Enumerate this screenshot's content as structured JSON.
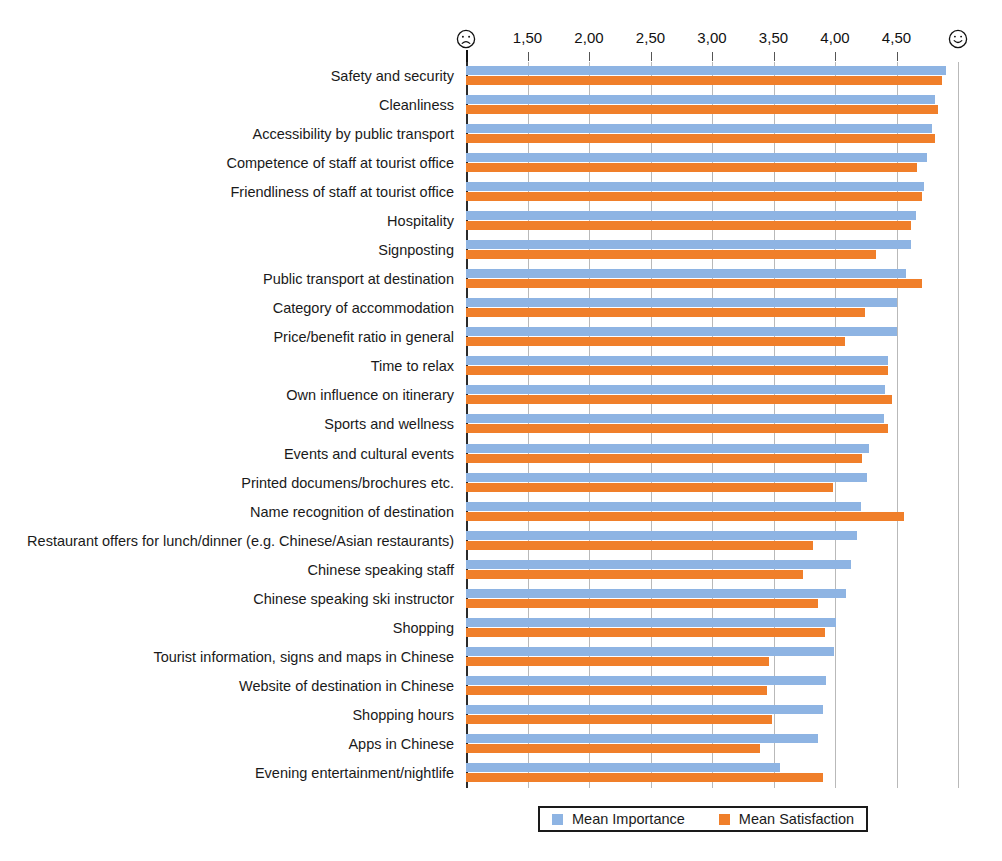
{
  "chart_data": {
    "type": "bar",
    "orientation": "horizontal",
    "title": "",
    "xlabel": "",
    "ylabel": "",
    "xlim": [
      1.0,
      5.0
    ],
    "grid": true,
    "legend_position": "bottom-center",
    "axis": {
      "tick_values": [
        1.5,
        2.0,
        2.5,
        3.0,
        3.5,
        4.0,
        4.5
      ],
      "tick_labels": [
        "1,50",
        "2,00",
        "2,50",
        "3,00",
        "3,50",
        "4,00",
        "4,50"
      ],
      "start_icon": "frowning-face-icon",
      "end_icon": "smiling-face-icon",
      "start_value": 1.0,
      "end_value": 5.0
    },
    "categories": [
      "Safety and security",
      "Cleanliness",
      "Accessibility by public transport",
      "Competence of staff at tourist office",
      "Friendliness of staff at tourist office",
      "Hospitality",
      "Signposting",
      "Public transport at destination",
      "Category of accommodation",
      "Price/benefit ratio in general",
      "Time to relax",
      "Own influence on itinerary",
      "Sports and wellness",
      "Events and cultural events",
      "Printed documens/brochures etc.",
      "Name recognition of destination",
      "Restaurant offers for lunch/dinner (e.g. Chinese/Asian restaurants)",
      "Chinese speaking staff",
      "Chinese speaking ski instructor",
      "Shopping",
      "Tourist information, signs and maps in Chinese",
      "Website of destination in Chinese",
      "Shopping hours",
      "Apps in Chinese",
      "Evening entertainment/nightlife"
    ],
    "series": [
      {
        "name": "Mean Importance",
        "color": "#8eb4e3",
        "values": [
          4.9,
          4.81,
          4.79,
          4.75,
          4.72,
          4.66,
          4.62,
          4.58,
          4.5,
          4.5,
          4.43,
          4.41,
          4.4,
          4.28,
          4.26,
          4.21,
          4.18,
          4.13,
          4.09,
          4.01,
          3.99,
          3.93,
          3.9,
          3.86,
          3.55
        ]
      },
      {
        "name": "Mean Satisfaction",
        "color": "#f07f2a",
        "values": [
          4.87,
          4.84,
          4.81,
          4.67,
          4.71,
          4.62,
          4.33,
          4.71,
          4.24,
          4.08,
          4.43,
          4.46,
          4.43,
          4.22,
          3.98,
          4.56,
          3.82,
          3.74,
          3.86,
          3.92,
          3.46,
          3.45,
          3.49,
          3.39,
          3.9
        ]
      }
    ]
  },
  "legend": {
    "items": [
      {
        "label": "Mean Importance",
        "color": "#8eb4e3"
      },
      {
        "label": "Mean Satisfaction",
        "color": "#f07f2a"
      }
    ]
  }
}
